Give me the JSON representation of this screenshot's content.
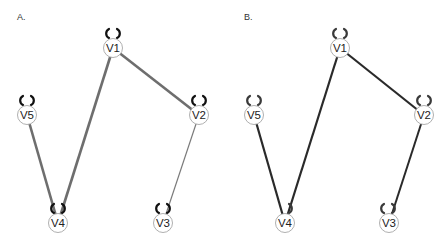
{
  "panels": [
    {
      "label": "A.",
      "edge_color": "#6e6e6e",
      "loop_color": "#111111",
      "nodes": [
        {
          "id": "V1",
          "label": "V1",
          "x": 113,
          "y": 48
        },
        {
          "id": "V2",
          "label": "V2",
          "x": 199,
          "y": 115
        },
        {
          "id": "V3",
          "label": "V3",
          "x": 163,
          "y": 223
        },
        {
          "id": "V4",
          "label": "V4",
          "x": 58,
          "y": 223
        },
        {
          "id": "V5",
          "label": "V5",
          "x": 27,
          "y": 115
        }
      ],
      "edges": [
        {
          "from": "V1",
          "to": "V2",
          "width": 2.6
        },
        {
          "from": "V1",
          "to": "V4",
          "width": 2.6
        },
        {
          "from": "V5",
          "to": "V4",
          "width": 2.6
        },
        {
          "from": "V2",
          "to": "V3",
          "width": 1.2
        }
      ]
    },
    {
      "label": "B.",
      "edge_color": "#2a2a2a",
      "loop_color": "#333333",
      "nodes": [
        {
          "id": "V1",
          "label": "V1",
          "x": 340,
          "y": 48
        },
        {
          "id": "V2",
          "label": "V2",
          "x": 424,
          "y": 115
        },
        {
          "id": "V3",
          "label": "V3",
          "x": 389,
          "y": 223
        },
        {
          "id": "V4",
          "label": "V4",
          "x": 285,
          "y": 223
        },
        {
          "id": "V5",
          "label": "V5",
          "x": 254,
          "y": 115
        }
      ],
      "edges": [
        {
          "from": "V1",
          "to": "V2",
          "width": 2.2
        },
        {
          "from": "V1",
          "to": "V4",
          "width": 2.2
        },
        {
          "from": "V5",
          "to": "V4",
          "width": 2.2
        },
        {
          "from": "V2",
          "to": "V3",
          "width": 2.0
        }
      ]
    }
  ]
}
